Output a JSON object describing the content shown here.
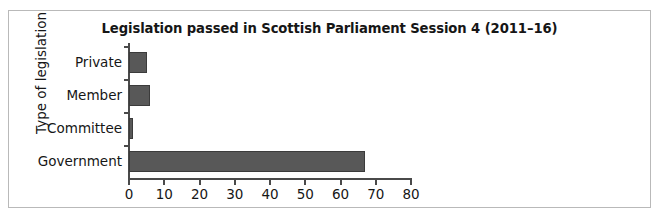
{
  "figure": {
    "frame_border_color": "#b9b9b9",
    "background_color": "#ffffff"
  },
  "chart_data": {
    "type": "bar",
    "orientation": "horizontal",
    "title": "Legislation passed in Scottish Parliament Session 4 (2011–16)",
    "xlabel": "",
    "ylabel": "Type of legislation",
    "categories": [
      "Government",
      "Committee",
      "Member",
      "Private"
    ],
    "values": [
      67,
      1,
      6,
      5
    ],
    "series": [
      {
        "name": "Acts passed",
        "values": [
          67,
          1,
          6,
          5
        ]
      }
    ],
    "xlim": [
      0,
      80
    ],
    "xticks": [
      0,
      10,
      20,
      30,
      40,
      50,
      60,
      70,
      80
    ],
    "xtick_labels": [
      "0",
      "10",
      "20",
      "30",
      "40",
      "50",
      "60",
      "70",
      "80"
    ],
    "grid": false,
    "legend": false,
    "bar_fill_color": "#585858",
    "bar_edge_color": "#3b3b3b",
    "axis_color": "#4a4a4a"
  }
}
